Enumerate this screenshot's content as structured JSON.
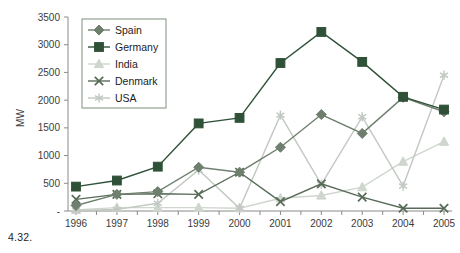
{
  "caption": "4.32.",
  "axes": {
    "ylabel": "MW",
    "yticks": [
      "-",
      "500",
      "1000",
      "1500",
      "2000",
      "2500",
      "3000",
      "3500"
    ],
    "xticks": [
      "1996",
      "1997",
      "1998",
      "1999",
      "2000",
      "2001",
      "2002",
      "2003",
      "2004",
      "2005"
    ]
  },
  "legend": {
    "position": "top-left",
    "entries": [
      {
        "label": "Spain",
        "marker": "diamond",
        "color": "#6e7f6e"
      },
      {
        "label": "Germany",
        "marker": "square",
        "color": "#2f5138"
      },
      {
        "label": "India",
        "marker": "triangle",
        "color": "#cfd6ce"
      },
      {
        "label": "Denmark",
        "marker": "x",
        "color": "#586b58"
      },
      {
        "label": "USA",
        "marker": "asterisk",
        "color": "#c2c8c2"
      }
    ]
  },
  "chart_data": {
    "type": "line",
    "title": "",
    "xlabel": "",
    "ylabel": "MW",
    "ylim": [
      0,
      3500
    ],
    "ytick_step": 500,
    "grid": false,
    "legend_position": "top-left",
    "categories": [
      "1996",
      "1997",
      "1998",
      "1999",
      "2000",
      "2001",
      "2002",
      "2003",
      "2004",
      "2005"
    ],
    "series": [
      {
        "name": "Spain",
        "marker": "diamond",
        "color": "#6e7f6e",
        "values": [
          100,
          300,
          350,
          790,
          700,
          1150,
          1740,
          1400,
          2050,
          1790
        ]
      },
      {
        "name": "Germany",
        "marker": "square",
        "color": "#2f5138",
        "values": [
          440,
          550,
          800,
          1580,
          1680,
          2670,
          3230,
          2690,
          2060,
          1830
        ]
      },
      {
        "name": "India",
        "marker": "triangle",
        "color": "#cfd6ce",
        "values": [
          20,
          60,
          60,
          60,
          50,
          230,
          280,
          430,
          890,
          1250
        ]
      },
      {
        "name": "Denmark",
        "marker": "x",
        "color": "#586b58",
        "values": [
          210,
          300,
          310,
          300,
          700,
          170,
          490,
          250,
          50,
          50
        ]
      },
      {
        "name": "USA",
        "marker": "asterisk",
        "color": "#c2c8c2",
        "values": [
          10,
          30,
          140,
          740,
          50,
          1730,
          480,
          1700,
          450,
          2450
        ]
      }
    ]
  }
}
